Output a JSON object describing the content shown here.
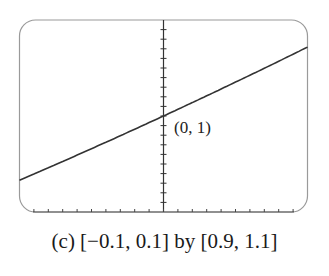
{
  "figure": {
    "caption": "(c) [−0.1, 0.1] by [0.9, 1.1]",
    "point_label": "(0, 1)"
  },
  "colors": {
    "frame": "#9a9a9a",
    "axis": "#333333",
    "curve": "#333333",
    "background": "#ffffff"
  },
  "chart_data": {
    "type": "line",
    "title": "",
    "caption": "(c) [−0.1, 0.1] by [0.9, 1.1]",
    "xlabel": "",
    "ylabel": "",
    "xlim": [
      -0.1,
      0.1
    ],
    "ylim": [
      0.9,
      1.1
    ],
    "xscl": 0.01,
    "yscl": 0.01,
    "grid": false,
    "legend": null,
    "axes_style": "calculator-window with tick marks, y-axis at x=0, x-axis ticks along bottom edge",
    "series": [
      {
        "name": "y = 2^x",
        "x": [
          -0.1,
          -0.08,
          -0.06,
          -0.04,
          -0.02,
          0.0,
          0.02,
          0.04,
          0.06,
          0.08,
          0.1
        ],
        "y": [
          0.933,
          0.946,
          0.959,
          0.973,
          0.986,
          1.0,
          1.014,
          1.028,
          1.042,
          1.057,
          1.072
        ]
      }
    ],
    "annotations": [
      {
        "text": "(0, 1)",
        "x": 0,
        "y": 1
      }
    ]
  }
}
